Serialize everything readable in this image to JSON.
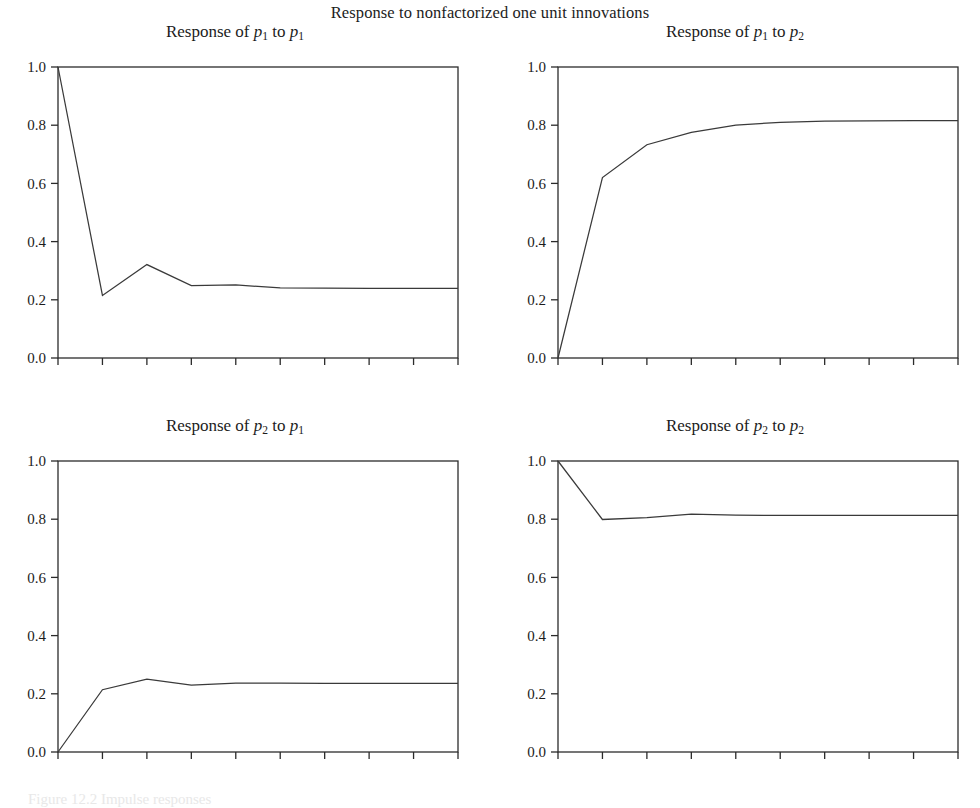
{
  "figure": {
    "title": "Response to nonfactorized one unit innovations",
    "caption": "Figure 12.2  Impulse responses",
    "background": "#ffffff",
    "line_color": "#3a3a3a",
    "axis_color": "#2b2b2b"
  },
  "chart_data": [
    {
      "type": "line",
      "title": "Response of p₁ to p₁",
      "title_parts": {
        "prefix": "Response of ",
        "from": "p",
        "from_sub": "1",
        "mid": " to ",
        "to": "p",
        "to_sub": "1"
      },
      "x": [
        1,
        2,
        3,
        4,
        5,
        6,
        7,
        8,
        9,
        10
      ],
      "values": [
        1.0,
        0.215,
        0.321,
        0.249,
        0.251,
        0.241,
        0.24,
        0.239,
        0.239,
        0.239
      ],
      "xlabel": "",
      "ylabel": "",
      "xlim": [
        1,
        10
      ],
      "ylim": [
        0.0,
        1.0
      ],
      "xticks": [
        "1",
        "2",
        "3",
        "4",
        "5",
        "6",
        "7",
        "8",
        "9",
        "10"
      ],
      "yticks": [
        "0.0",
        "0.2",
        "0.4",
        "0.6",
        "0.8",
        "1.0"
      ],
      "ytick_values": [
        0.0,
        0.2,
        0.4,
        0.6,
        0.8,
        1.0
      ],
      "grid": false,
      "legend": null
    },
    {
      "type": "line",
      "title": "Response of p₁ to p₂",
      "title_parts": {
        "prefix": "Response of ",
        "from": "p",
        "from_sub": "1",
        "mid": " to ",
        "to": "p",
        "to_sub": "2"
      },
      "x": [
        1,
        2,
        3,
        4,
        5,
        6,
        7,
        8,
        9,
        10
      ],
      "values": [
        0.0,
        0.62,
        0.733,
        0.775,
        0.8,
        0.81,
        0.814,
        0.815,
        0.816,
        0.816
      ],
      "xlabel": "",
      "ylabel": "",
      "xlim": [
        1,
        10
      ],
      "ylim": [
        0.0,
        1.0
      ],
      "xticks": [
        "1",
        "2",
        "3",
        "4",
        "5",
        "6",
        "7",
        "8",
        "9",
        "10"
      ],
      "yticks": [
        "0.0",
        "0.2",
        "0.4",
        "0.6",
        "0.8",
        "1.0"
      ],
      "ytick_values": [
        0.0,
        0.2,
        0.4,
        0.6,
        0.8,
        1.0
      ],
      "grid": false,
      "legend": null
    },
    {
      "type": "line",
      "title": "Response of p₂ to p₁",
      "title_parts": {
        "prefix": "Response of ",
        "from": "p",
        "from_sub": "2",
        "mid": " to ",
        "to": "p",
        "to_sub": "1"
      },
      "x": [
        1,
        2,
        3,
        4,
        5,
        6,
        7,
        8,
        9,
        10
      ],
      "values": [
        0.0,
        0.214,
        0.25,
        0.23,
        0.237,
        0.237,
        0.236,
        0.236,
        0.236,
        0.236
      ],
      "xlabel": "",
      "ylabel": "",
      "xlim": [
        1,
        10
      ],
      "ylim": [
        0.0,
        1.0
      ],
      "xticks": [
        "1",
        "2",
        "3",
        "4",
        "5",
        "6",
        "7",
        "8",
        "9",
        "10"
      ],
      "yticks": [
        "0.0",
        "0.2",
        "0.4",
        "0.6",
        "0.8",
        "1.0"
      ],
      "ytick_values": [
        0.0,
        0.2,
        0.4,
        0.6,
        0.8,
        1.0
      ],
      "grid": false,
      "legend": null
    },
    {
      "type": "line",
      "title": "Response of p₂ to p₂",
      "title_parts": {
        "prefix": "Response of ",
        "from": "p",
        "from_sub": "2",
        "mid": " to ",
        "to": "p",
        "to_sub": "2"
      },
      "x": [
        1,
        2,
        3,
        4,
        5,
        6,
        7,
        8,
        9,
        10
      ],
      "values": [
        1.0,
        0.799,
        0.805,
        0.817,
        0.814,
        0.813,
        0.813,
        0.813,
        0.813,
        0.813
      ],
      "xlabel": "",
      "ylabel": "",
      "xlim": [
        1,
        10
      ],
      "ylim": [
        0.0,
        1.0
      ],
      "xticks": [
        "1",
        "2",
        "3",
        "4",
        "5",
        "6",
        "7",
        "8",
        "9",
        "10"
      ],
      "yticks": [
        "0.0",
        "0.2",
        "0.4",
        "0.6",
        "0.8",
        "1.0"
      ],
      "ytick_values": [
        0.0,
        0.2,
        0.4,
        0.6,
        0.8,
        1.0
      ],
      "grid": false,
      "legend": null
    }
  ]
}
